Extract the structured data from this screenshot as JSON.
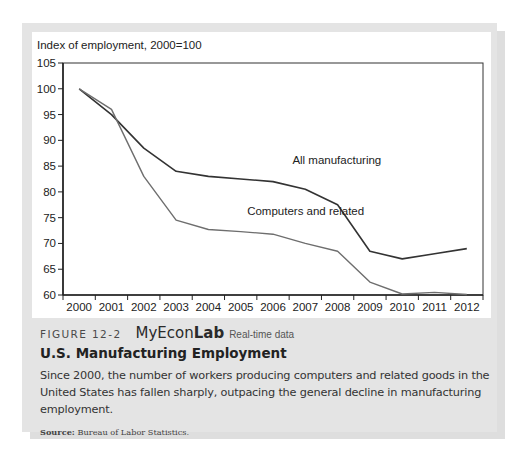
{
  "figure": {
    "number": "FIGURE 12-2",
    "brand_prefix": "My",
    "brand_mid": "Econ",
    "brand_suffix": "Lab",
    "brand_note": "Real-time data",
    "title": "U.S. Manufacturing Employment",
    "description": "Since 2000, the number of workers producing computers and related goods in the United States has fallen sharply, outpacing the general decline in manufacturing employment.",
    "source_label": "Source:",
    "source_text": "Bureau of Labor Statistics."
  },
  "colors": {
    "all_manufacturing": "#333333",
    "computers": "#6e6e6e",
    "frame": "#e4e4e4",
    "panel": "#ffffff"
  },
  "chart_data": {
    "type": "line",
    "title": "",
    "ylabel": "Index of employment, 2000=100",
    "xlabel": "",
    "x": [
      "2000",
      "2001",
      "2002",
      "2003",
      "2004",
      "2005",
      "2006",
      "2007",
      "2008",
      "2009",
      "2010",
      "2011",
      "2012"
    ],
    "ylim": [
      60,
      105
    ],
    "yticks": [
      60,
      65,
      70,
      75,
      80,
      85,
      90,
      95,
      100,
      105
    ],
    "grid": false,
    "legend": "inline labels",
    "series": [
      {
        "name": "All manufacturing",
        "values": [
          100,
          95,
          88.5,
          84,
          83,
          82.5,
          82,
          80.5,
          77.5,
          68.5,
          67,
          68,
          69
        ]
      },
      {
        "name": "Computers and related",
        "values": [
          100,
          96,
          83,
          74.5,
          72.7,
          72.3,
          71.8,
          70,
          68.5,
          62.5,
          60.2,
          60.5,
          60.1
        ]
      }
    ],
    "annotations": [
      {
        "text": "All manufacturing",
        "x": 2006.6,
        "y": 85.5
      },
      {
        "text": "Computers and related",
        "x": 2005.2,
        "y": 75.5
      }
    ]
  }
}
